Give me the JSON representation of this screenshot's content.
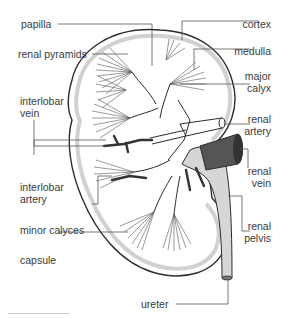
{
  "diagram": {
    "colors": {
      "outline": "#2b2b2b",
      "capsule_fill": "#e2e2e2",
      "pelvis_fill": "#d6d6d6",
      "vein_fill": "#555555",
      "label_text": "#3a3a3a",
      "leader_line": "#555555"
    },
    "labels_left": [
      {
        "id": "papilla",
        "text": "papilla"
      },
      {
        "id": "renal-pyramids",
        "text": "renal pyramids"
      },
      {
        "id": "interlobar-vein",
        "line1": "interlobar",
        "line2": "vein"
      },
      {
        "id": "interlobar-artery",
        "line1": "interlobar",
        "line2": "artery"
      },
      {
        "id": "minor-calyces",
        "text": "minor calyces"
      },
      {
        "id": "capsule",
        "text": "capsule"
      }
    ],
    "labels_right": [
      {
        "id": "cortex",
        "text": "cortex"
      },
      {
        "id": "medulla",
        "text": "medulla"
      },
      {
        "id": "major-calyx",
        "line1": "major",
        "line2": "calyx"
      },
      {
        "id": "renal-artery",
        "line1": "renal",
        "line2": "artery"
      },
      {
        "id": "renal-vein",
        "line1": "renal",
        "line2": "vein"
      },
      {
        "id": "renal-pelvis",
        "line1": "renal",
        "line2": "pelvis"
      }
    ],
    "labels_bottom": [
      {
        "id": "ureter",
        "text": "ureter"
      }
    ]
  }
}
